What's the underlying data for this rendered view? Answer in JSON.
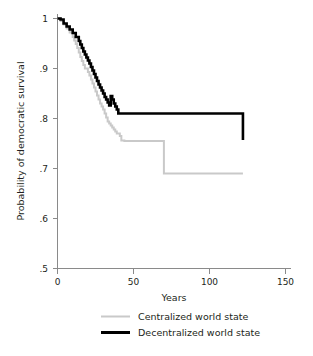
{
  "chart_data": {
    "type": "line",
    "title": "",
    "subtitle": "",
    "xlabel": "Years",
    "ylabel": "Probability of democratic survival",
    "xlim": [
      0,
      150
    ],
    "ylim": [
      0.5,
      1.0
    ],
    "xticks": [
      0,
      50,
      100,
      150
    ],
    "xticklabels": [
      "0",
      "50",
      "100",
      "150"
    ],
    "yticks": [
      0.5,
      0.6,
      0.7,
      0.8,
      0.9,
      1.0
    ],
    "yticklabels": [
      ".5",
      ".6",
      ".7",
      ".8",
      ".9",
      "1"
    ],
    "grid": false,
    "legend_position": "bottom",
    "step_interpolation": "post",
    "series": [
      {
        "name": "Centralized world state",
        "color": "#c9c9c9",
        "x": [
          0,
          2,
          4,
          6,
          8,
          10,
          11,
          12,
          13,
          14,
          15,
          16,
          17,
          18,
          19,
          20,
          21,
          22,
          23,
          24,
          25,
          26,
          27,
          28,
          29,
          30,
          31,
          32,
          33,
          34,
          35,
          36,
          37,
          38,
          39,
          40,
          41,
          42,
          44,
          68,
          70,
          122
        ],
        "y": [
          1.0,
          0.995,
          0.988,
          0.98,
          0.972,
          0.963,
          0.956,
          0.949,
          0.941,
          0.932,
          0.923,
          0.915,
          0.907,
          0.9,
          0.9,
          0.893,
          0.886,
          0.878,
          0.87,
          0.862,
          0.854,
          0.846,
          0.838,
          0.83,
          0.824,
          0.818,
          0.81,
          0.802,
          0.794,
          0.79,
          0.786,
          0.782,
          0.778,
          0.774,
          0.77,
          0.77,
          0.765,
          0.756,
          0.755,
          0.755,
          0.69,
          0.69
        ]
      },
      {
        "name": "Decentralized world state",
        "color": "#000000",
        "x": [
          0,
          2,
          4,
          6,
          8,
          10,
          12,
          14,
          15,
          16,
          17,
          18,
          19,
          20,
          21,
          22,
          23,
          24,
          25,
          26,
          27,
          28,
          29,
          30,
          31,
          32,
          33,
          34,
          35,
          36,
          37,
          38,
          39,
          40,
          41,
          68,
          122
        ],
        "y": [
          1.0,
          0.998,
          0.99,
          0.984,
          0.978,
          0.971,
          0.963,
          0.955,
          0.948,
          0.941,
          0.934,
          0.928,
          0.922,
          0.916,
          0.91,
          0.903,
          0.896,
          0.889,
          0.882,
          0.875,
          0.868,
          0.862,
          0.856,
          0.85,
          0.843,
          0.838,
          0.832,
          0.826,
          0.845,
          0.838,
          0.83,
          0.824,
          0.818,
          0.81,
          0.81,
          0.81,
          0.757
        ]
      }
    ],
    "annotations": []
  },
  "legend": {
    "items": [
      {
        "label": "Centralized world state",
        "color": "#c9c9c9"
      },
      {
        "label": "Decentralized world state",
        "color": "#000000"
      }
    ]
  },
  "axis": {
    "x_title": "Years",
    "y_title": "Probability of democratic survival",
    "x_tick_labels": [
      "0",
      "50",
      "100",
      "150"
    ],
    "y_tick_labels": [
      "1",
      ".9",
      ".8",
      ".7",
      ".6",
      ".5"
    ]
  },
  "colors": {
    "background": "#ffffff",
    "axis": "#8a8a8a",
    "text": "#231f20",
    "series_centralized": "#c9c9c9",
    "series_decentralized": "#000000"
  }
}
